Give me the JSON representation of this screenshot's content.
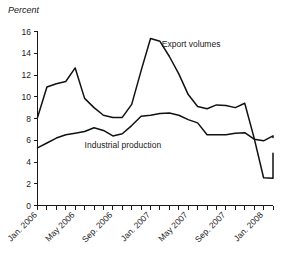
{
  "chart_data": {
    "type": "line",
    "title": "",
    "subtitle": "",
    "unit_label": "Percent",
    "xlabel": "",
    "ylabel": "Percent",
    "ylim": [
      0,
      16
    ],
    "yticks": [
      0,
      2,
      4,
      6,
      8,
      10,
      12,
      14,
      16
    ],
    "grid": false,
    "legend_position": "inline-annotation",
    "x": [
      "Jan. 2006",
      "Feb. 2006",
      "Mar. 2006",
      "Apr. 2006",
      "May 2006",
      "Jun. 2006",
      "Jul. 2006",
      "Aug. 2006",
      "Sep. 2006",
      "Oct. 2006",
      "Nov. 2006",
      "Dec. 2006",
      "Jan. 2007",
      "Feb. 2007",
      "Mar. 2007",
      "Apr. 2007",
      "May 2007",
      "Jun. 2007",
      "Jul. 2007",
      "Aug. 2007",
      "Sep. 2007",
      "Oct. 2007",
      "Nov. 2007",
      "Dec. 2007",
      "Jan. 2008",
      "Feb. 2008"
    ],
    "xtick_labels_shown": [
      "Jan. 2006",
      "May 2006",
      "Sep. 2006",
      "Jan. 2007",
      "May 2007",
      "Sep. 2007",
      "Jan. 2008"
    ],
    "xtick_label_indices": [
      0,
      4,
      8,
      12,
      16,
      20,
      24
    ],
    "series": [
      {
        "name": "Export volumes",
        "label_x_index": 13.2,
        "label_y_value": 14.6,
        "values": [
          8.1,
          10.9,
          11.2,
          11.4,
          12.65,
          9.85,
          9.0,
          8.3,
          8.1,
          8.1,
          9.3,
          12.4,
          15.35,
          15.1,
          13.7,
          12.1,
          10.2,
          9.1,
          8.9,
          9.25,
          9.2,
          9.0,
          9.4,
          6.2,
          2.55,
          2.5
        ],
        "final_extra_value": 4.8
      },
      {
        "name": "Industrial production",
        "label_x_index": 5.0,
        "label_y_value": 5.3,
        "values": [
          5.3,
          5.75,
          6.2,
          6.5,
          6.65,
          6.8,
          7.15,
          6.9,
          6.4,
          6.6,
          7.35,
          8.2,
          8.3,
          8.45,
          8.5,
          8.3,
          7.9,
          7.6,
          6.5,
          6.5,
          6.5,
          6.65,
          6.7,
          6.1,
          5.95,
          6.4
        ],
        "final_extra_value": 6.25
      }
    ]
  }
}
